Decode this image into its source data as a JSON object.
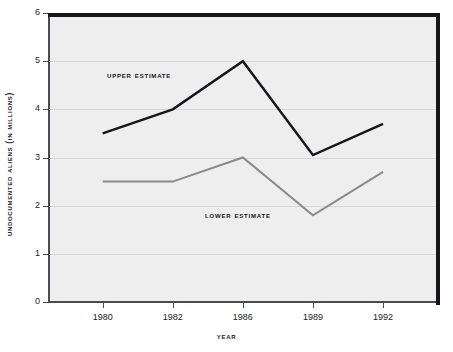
{
  "chart_data": {
    "type": "line",
    "title": "",
    "xlabel": "Year",
    "ylabel": "Undocumented Aliens (in Millions)",
    "categories": [
      "1980",
      "1982",
      "1986",
      "1989",
      "1992"
    ],
    "ylim": [
      0,
      6
    ],
    "ytick_labels": [
      "0",
      "1",
      "2",
      "3",
      "4",
      "5",
      "6"
    ],
    "ytick_values": [
      0,
      1,
      2,
      3,
      4,
      5,
      6
    ],
    "grid": true,
    "legend_position": "inline-annotation",
    "series": [
      {
        "name": "Upper Estimate",
        "values": [
          3.5,
          4.0,
          5.0,
          3.05,
          3.7
        ],
        "color": "#15151a"
      },
      {
        "name": "Lower Estimate",
        "values": [
          2.5,
          2.5,
          3.0,
          1.8,
          2.7
        ],
        "color": "#8a8a8a"
      }
    ],
    "annotations": [
      {
        "text": "Upper Estimate",
        "series": "Upper Estimate"
      },
      {
        "text": "Lower Estimate",
        "series": "Lower Estimate"
      }
    ],
    "plot_background": "#eeeeee",
    "gridline_color": "#d8d8d8",
    "frame_color": "#15151a"
  }
}
